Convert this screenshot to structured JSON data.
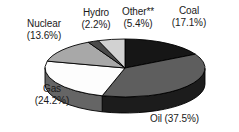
{
  "chart_data": {
    "type": "pie",
    "title": "",
    "subtitle": "",
    "xlabel": "",
    "ylabel": "",
    "legend_position": "none",
    "grid": false,
    "three_d": true,
    "categories": [
      "Coal",
      "Oil",
      "Gas",
      "Nuclear",
      "Hydro",
      "Other**"
    ],
    "values": [
      17.1,
      37.5,
      24.2,
      13.6,
      2.2,
      5.4
    ],
    "value_unit": "%",
    "slices": [
      {
        "name": "Coal",
        "value": 17.1,
        "label": "Coal",
        "value_label": "(17.1%)",
        "top_color": "#161616",
        "side_color": "#0d0d0d"
      },
      {
        "name": "Oil",
        "value": 37.5,
        "label": "Oil",
        "value_label": "(37.5%)",
        "top_color": "#5e5e5e",
        "side_color": "#1c1c1c"
      },
      {
        "name": "Gas",
        "value": 24.2,
        "label": "Gas",
        "value_label": "(24.2%)",
        "top_color": "#fdfdfd",
        "side_color": "#656565"
      },
      {
        "name": "Nuclear",
        "value": 13.6,
        "label": "Nuclear",
        "value_label": "(13.6%)",
        "top_color": "#a8a8a8",
        "side_color": "#7a7a7a"
      },
      {
        "name": "Hydro",
        "value": 2.2,
        "label": "Hydro",
        "value_label": "(2.2%)",
        "top_color": "#4a4a4a",
        "side_color": "#333333"
      },
      {
        "name": "Other**",
        "value": 5.4,
        "label": "Other**",
        "value_label": "(5.4%)",
        "top_color": "#d2d2d2",
        "side_color": "#9a9a9a"
      }
    ],
    "annotations": [
      "**"
    ]
  },
  "labels": {
    "coal": {
      "name": "Coal",
      "value": "(17.1%)"
    },
    "oil": {
      "name": "Oil (37.5%)"
    },
    "gas": {
      "name": "Gas",
      "value": "(24.2%)"
    },
    "nuclear": {
      "name": "Nuclear",
      "value": "(13.6%)"
    },
    "hydro": {
      "name": "Hydro",
      "value": "(2.2%)"
    },
    "other": {
      "name": "Other**",
      "value": "(5.4%)"
    }
  },
  "style": {
    "outline_color": "#000000",
    "background": "#ffffff",
    "text_color": "#1a1a1a"
  }
}
